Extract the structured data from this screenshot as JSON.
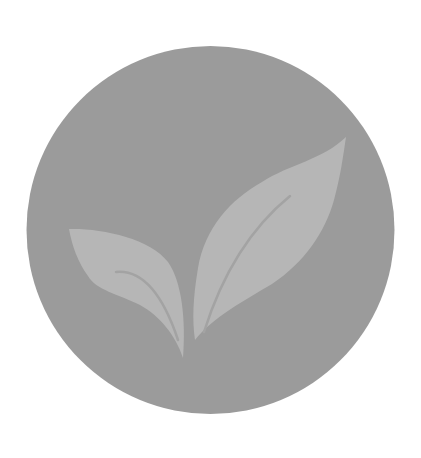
{
  "image": {
    "subject": "sprout-logo",
    "description": "Gray circular badge with a two-leaf sprout"
  },
  "colors": {
    "background": "#ffffff",
    "circle": "#9b9b9b",
    "leaf": "#b6b6b6",
    "vein": "#a3a3a3"
  },
  "icon": {
    "name": "sprout-icon"
  }
}
